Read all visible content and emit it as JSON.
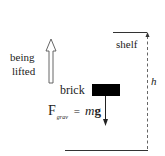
{
  "diagram": {
    "labels": {
      "motion": [
        "being",
        "lifted"
      ],
      "shelf": "shelf",
      "height": "h",
      "object": "brick",
      "force_F": "F",
      "force_sub": "grav",
      "force_eq": "=",
      "force_m": "m",
      "force_g": "g"
    },
    "colors": {
      "ink": "#1a1a1a",
      "line": "#333333",
      "brick": "#000000",
      "dashed": "#666666"
    }
  }
}
